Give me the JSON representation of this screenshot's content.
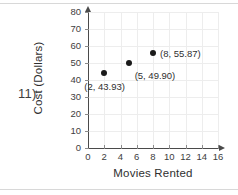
{
  "question": {
    "number_label": "11)"
  },
  "chart_data": {
    "type": "scatter",
    "title": "",
    "xlabel": "Movies Rented",
    "ylabel": "Cost (Dollars)",
    "xlim": [
      0,
      16
    ],
    "ylim": [
      0,
      80
    ],
    "xticks": [
      "0",
      "2",
      "4",
      "6",
      "8",
      "10",
      "12",
      "14",
      "16"
    ],
    "yticks": [
      "0",
      "10",
      "20",
      "30",
      "40",
      "50",
      "60",
      "70",
      "80"
    ],
    "xtick_values": [
      0,
      2,
      4,
      6,
      8,
      10,
      12,
      14,
      16
    ],
    "ytick_values": [
      0,
      10,
      20,
      30,
      40,
      50,
      60,
      70,
      80
    ],
    "grid": true,
    "legend": "none",
    "points": [
      {
        "x": 2,
        "y": 43.93,
        "label": "(2, 43.93)"
      },
      {
        "x": 5,
        "y": 49.9,
        "label": "(5, 49.90)"
      },
      {
        "x": 8,
        "y": 55.87,
        "label": "(8, 55.87)"
      }
    ],
    "colors": {
      "point": "#1a1a1a",
      "axis": "#4a4a4a",
      "grid": "#ededed",
      "text": "#2f2f2f",
      "background": "#ffffff"
    }
  }
}
